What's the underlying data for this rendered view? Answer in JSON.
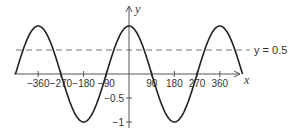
{
  "chart_data": {
    "type": "line",
    "title": "",
    "xlabel": "x",
    "ylabel": "y",
    "xlim": [
      -450,
      450
    ],
    "ylim": [
      -1,
      1
    ],
    "grid": false,
    "series": [
      {
        "name": "y = cos x",
        "function": "cos",
        "x_range": [
          -450,
          450
        ],
        "color": "#222222"
      }
    ],
    "reference_lines": [
      {
        "type": "horizontal",
        "y": 0.5,
        "style": "dashed",
        "label": "y = 0.5",
        "color": "#777777"
      }
    ],
    "x_ticks": [
      -360,
      -270,
      -180,
      -90,
      90,
      180,
      270,
      360
    ],
    "x_tick_labels": [
      "−360",
      "−270",
      "−180",
      "−90",
      "90",
      "180",
      "270",
      "360"
    ],
    "y_ticks": [
      -0.5,
      -1
    ],
    "y_tick_labels": [
      "−0.5",
      "−1"
    ]
  },
  "labels": {
    "x_axis": "x",
    "y_axis": "y",
    "ref_line": "y = 0.5"
  },
  "colors": {
    "curve": "#222222",
    "axis": "#555555",
    "dashed": "#777777"
  }
}
